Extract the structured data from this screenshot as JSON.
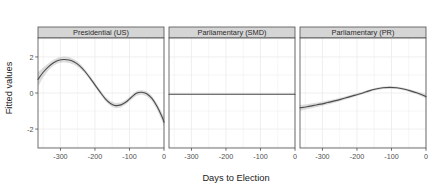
{
  "chart_data": {
    "type": "line",
    "title": "",
    "xlabel": "Days to Election",
    "ylabel": "Fitted values",
    "grid": true,
    "legend": false,
    "facet_layout": "1 row x 3 columns, shared y axis",
    "xlim": [
      -365,
      0
    ],
    "ylim": [
      -3.05,
      3.05
    ],
    "xticks": [
      -300,
      -200,
      -100,
      0
    ],
    "xtick_labels": [
      "-300",
      "-200",
      "-100",
      "0"
    ],
    "yticks": [
      2,
      0,
      -2
    ],
    "ytick_labels": [
      "2",
      "0",
      "-2"
    ],
    "line_color": "#4d4d4d",
    "ribbon_color": "#bfbfbf",
    "panel_border_color": "#4d4d4d",
    "strip_fill": "#d5d5d5",
    "grid_color": "#ebebeb",
    "panels": [
      {
        "label": "Presidential (US)",
        "x": [
          -365,
          -350,
          -335,
          -320,
          -305,
          -290,
          -275,
          -260,
          -245,
          -230,
          -215,
          -200,
          -185,
          -170,
          -155,
          -140,
          -125,
          -110,
          -95,
          -80,
          -65,
          -50,
          -35,
          -20,
          -5,
          0
        ],
        "fit": [
          0.75,
          1.15,
          1.45,
          1.68,
          1.82,
          1.86,
          1.83,
          1.72,
          1.52,
          1.22,
          0.85,
          0.45,
          0.05,
          -0.32,
          -0.58,
          -0.7,
          -0.66,
          -0.5,
          -0.25,
          -0.02,
          0.04,
          -0.04,
          -0.3,
          -0.75,
          -1.35,
          -1.62
        ],
        "lower": [
          0.35,
          0.88,
          1.25,
          1.52,
          1.66,
          1.7,
          1.67,
          1.57,
          1.38,
          1.09,
          0.73,
          0.33,
          -0.07,
          -0.45,
          -0.72,
          -0.85,
          -0.8,
          -0.63,
          -0.38,
          -0.15,
          -0.09,
          -0.18,
          -0.45,
          -0.93,
          -1.58,
          -1.9
        ],
        "upper": [
          1.15,
          1.42,
          1.65,
          1.84,
          1.98,
          2.02,
          1.99,
          1.87,
          1.66,
          1.35,
          0.97,
          0.57,
          0.17,
          -0.19,
          -0.44,
          -0.55,
          -0.52,
          -0.37,
          -0.12,
          0.11,
          0.17,
          0.1,
          -0.15,
          -0.57,
          -1.12,
          -1.34
        ]
      },
      {
        "label": "Parliamentary (SMD)",
        "x": [
          -365,
          -300,
          -200,
          -100,
          -20,
          0
        ],
        "fit": [
          -0.07,
          -0.07,
          -0.07,
          -0.07,
          -0.07,
          -0.07
        ],
        "lower": [
          -0.1,
          -0.1,
          -0.1,
          -0.1,
          -0.1,
          -0.1
        ],
        "upper": [
          -0.04,
          -0.04,
          -0.04,
          -0.04,
          -0.04,
          -0.04
        ]
      },
      {
        "label": "Parliamentary (PR)",
        "x": [
          -365,
          -345,
          -325,
          -305,
          -285,
          -265,
          -245,
          -225,
          -205,
          -185,
          -165,
          -145,
          -125,
          -105,
          -85,
          -65,
          -45,
          -25,
          -5,
          0
        ],
        "fit": [
          -0.82,
          -0.76,
          -0.69,
          -0.62,
          -0.53,
          -0.44,
          -0.34,
          -0.23,
          -0.12,
          -0.01,
          0.12,
          0.22,
          0.29,
          0.31,
          0.29,
          0.22,
          0.12,
          0.0,
          -0.15,
          -0.2
        ],
        "lower": [
          -0.98,
          -0.9,
          -0.82,
          -0.74,
          -0.64,
          -0.54,
          -0.43,
          -0.32,
          -0.2,
          -0.09,
          0.04,
          0.15,
          0.22,
          0.24,
          0.22,
          0.15,
          0.04,
          -0.09,
          -0.27,
          -0.33
        ],
        "upper": [
          -0.66,
          -0.62,
          -0.56,
          -0.5,
          -0.42,
          -0.34,
          -0.25,
          -0.14,
          -0.04,
          0.07,
          0.2,
          0.29,
          0.36,
          0.38,
          0.36,
          0.29,
          0.2,
          0.09,
          -0.03,
          -0.07
        ]
      }
    ]
  }
}
